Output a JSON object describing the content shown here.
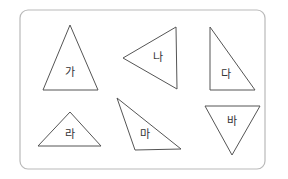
{
  "diagram": {
    "frame": {
      "x": 20,
      "y": 10,
      "width": 245,
      "height": 159,
      "radius": 8,
      "stroke": "#b9b9b9"
    },
    "stroke_color": "#555555",
    "triangles": [
      {
        "label": "가",
        "points": "70,25 43,90 98,90",
        "label_x": 70,
        "label_y": 73
      },
      {
        "label": "나",
        "points": "123,58 176,27 177,89",
        "label_x": 158,
        "label_y": 58
      },
      {
        "label": "다",
        "points": "210,27 210,90 255,90",
        "label_x": 226,
        "label_y": 75
      },
      {
        "label": "라",
        "points": "70,112 38,146 101,146",
        "label_x": 70,
        "label_y": 135
      },
      {
        "label": "마",
        "points": "117,98 135,150 181,149",
        "label_x": 145,
        "label_y": 135
      },
      {
        "label": "바",
        "points": "205,106 260,106 232,155",
        "label_x": 232,
        "label_y": 122
      }
    ]
  }
}
